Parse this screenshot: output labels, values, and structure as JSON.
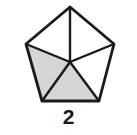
{
  "figure": {
    "kind": "shaded-polygon-fraction-diagram",
    "shape_name": "pentagon",
    "label": "2",
    "total_parts": 5,
    "shaded_parts": 2,
    "unshaded_parts": 3,
    "colors": {
      "background": "#ffffff",
      "stroke": "#1a1a1a",
      "shaded_fill": "#d6d6d6",
      "unshaded_fill": "#ffffff",
      "label_color": "#1a1a1a"
    },
    "geometry": {
      "center": {
        "x": 70,
        "y": 62
      },
      "vertices": [
        {
          "name": "apex",
          "x": 70,
          "y": 7
        },
        {
          "name": "right",
          "x": 114,
          "y": 44
        },
        {
          "name": "bottom-right",
          "x": 99,
          "y": 101
        },
        {
          "name": "bottom-left",
          "x": 42,
          "y": 101
        },
        {
          "name": "left",
          "x": 26,
          "y": 44
        }
      ]
    },
    "wedges": [
      {
        "name": "wedge-top-left",
        "points": "70,7 26,44 70,62",
        "shaded": false
      },
      {
        "name": "wedge-top-right",
        "points": "70,7 114,44 70,62",
        "shaded": false
      },
      {
        "name": "wedge-right",
        "points": "114,44 99,101 70,62",
        "shaded": false
      },
      {
        "name": "wedge-bottom",
        "points": "99,101 42,101 70,62",
        "shaded": true
      },
      {
        "name": "wedge-left",
        "points": "42,101 26,44 70,62",
        "shaded": true
      }
    ],
    "outline_points": "70,7 114,44 99,101 42,101 26,44",
    "spokes": [
      {
        "name": "spoke-to-apex",
        "x1": 70,
        "y1": 62,
        "x2": 70,
        "y2": 7
      },
      {
        "name": "spoke-to-right",
        "x1": 70,
        "y1": 62,
        "x2": 114,
        "y2": 44
      },
      {
        "name": "spoke-to-bottom-right",
        "x1": 70,
        "y1": 62,
        "x2": 99,
        "y2": 101
      },
      {
        "name": "spoke-to-bottom-left",
        "x1": 70,
        "y1": 62,
        "x2": 42,
        "y2": 101
      },
      {
        "name": "spoke-to-left",
        "x1": 70,
        "y1": 62,
        "x2": 26,
        "y2": 44
      }
    ]
  }
}
